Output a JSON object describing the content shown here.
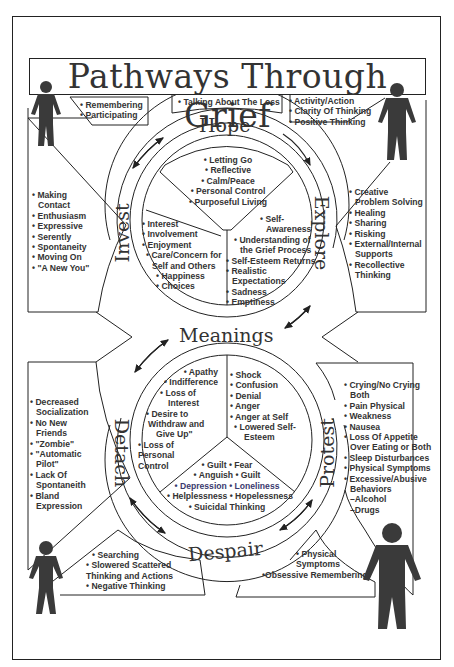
{
  "title": "Pathways Through Grief",
  "stages": {
    "hope": "Hope",
    "explore": "Explore",
    "invest": "Invest",
    "meanings": "Meanings",
    "detach": "Detach",
    "protest": "Protest",
    "despair": "Despair"
  },
  "boxes": {
    "top_left": [
      "• Remembering",
      "• Participating"
    ],
    "top_center": [
      "• Talking About The Loss"
    ],
    "top_right": [
      "• Activity/Action",
      "• Clarity Of Thinking",
      "• Positive Thinking"
    ],
    "left_upper": [
      "• Making",
      "  Contact",
      "• Enthusiasm",
      "• Expressive",
      "• Serently",
      "• Spontaneity",
      "• Moving On",
      "• \"A New You\""
    ],
    "right_upper": [
      "• Creative",
      "  Problem Solving",
      "• Healing",
      "• Sharing",
      "• Risking",
      "• External/Internal",
      "  Supports",
      "• Recollective",
      "  Thinking"
    ],
    "left_lower": [
      "• Decreased",
      "  Socialization",
      "• No New",
      "  Friends",
      "• \"Zombie\"",
      "• \"Automatic",
      "  Pilot\"",
      "• Lack Of",
      "  Spontaneith",
      "• Bland",
      "  Expression"
    ],
    "right_lower": [
      "• Crying/No Crying",
      "  Both",
      "• Pain Physical",
      "• Weakness",
      "• Nausea",
      "• Loss Of Appetite",
      "  Over Eating or Both",
      "• Sleep Disturbances",
      "• Physical Symptoms",
      "• Excessive/Abusive",
      "  Behaviors",
      "  –Alcohol",
      "  –Drugs"
    ],
    "bottom_left": [
      "• Searching",
      "• Slowered Scattered",
      "Thinking and Actions",
      "• Negative Thinking"
    ],
    "bottom_right": [
      "• Physical",
      "  Symptoms",
      "•Obsessive Remembering"
    ]
  },
  "upper_circle": {
    "top": [
      "• Letting Go",
      "• Reflective",
      "• Calm/Peace",
      "• Personal Control",
      "• Purposeful Living"
    ],
    "left": [
      "• Interest",
      "• Involvement",
      "• Enjoyment",
      "  • Care/Concern for",
      "  Self and Others",
      "    • Happiness",
      "    • Choices"
    ],
    "right": [
      "• Self-",
      "  Awareness",
      "• Understanding of",
      "  the Grief Process",
      "• Self-Esteem Returns",
      "• Realistic",
      "  Expectations",
      "• Sadness",
      "• Emptiness"
    ]
  },
  "lower_circle": {
    "left": [
      "• Apathy",
      "• Indifference",
      "• Loss of",
      "Interest",
      "• Desire to",
      "Withdraw and",
      "Give Up\"",
      "• Loss of",
      "Personal",
      "Control"
    ],
    "right": [
      "• Shock",
      "• Confusion",
      "• Denial",
      "• Anger",
      "• Anger at Self",
      "  • Lowered Self-",
      "    Esteem"
    ],
    "bottom": [
      "• Guilt • Fear",
      "• Anguish • Guilt",
      "• Depression • Loneliness",
      "• Helplessness • Hopelessness",
      "• Suicidal Thinking"
    ]
  },
  "figures": [
    "figure-top-left",
    "figure-top-right",
    "figure-bottom-left",
    "figure-bottom-right"
  ],
  "colors": {
    "line": "#222222",
    "text": "#333333",
    "figure": "#3a3a3a"
  }
}
